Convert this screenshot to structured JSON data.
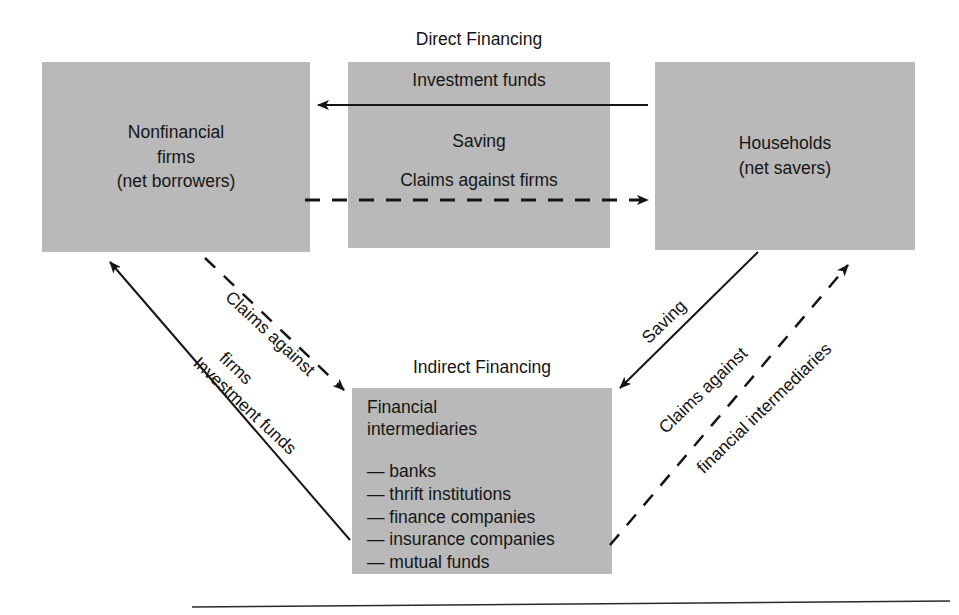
{
  "diagram": {
    "title_direct": "Direct Financing",
    "title_indirect": "Indirect Financing",
    "nodes": {
      "firms": {
        "line1": "Nonfinancial",
        "line2": "firms",
        "line3": "(net borrowers)"
      },
      "households": {
        "line1": "Households",
        "line2": "(net savers)"
      },
      "middle": {
        "label_top": "Investment funds",
        "label_mid": "Saving",
        "label_bottom": "Claims against firms"
      },
      "intermediaries": {
        "title_line1": "Financial",
        "title_line2": "intermediaries",
        "items": [
          "— banks",
          "— thrift institutions",
          "— finance companies",
          "— insurance companies",
          "— mutual funds"
        ]
      }
    },
    "flows": {
      "left_dashed": {
        "line1": "Claims against",
        "line2": "firms"
      },
      "left_solid": "Investment funds",
      "right_solid": "Saving",
      "right_dashed": {
        "line1": "Claims against",
        "line2": "financial intermediaries"
      }
    },
    "colors": {
      "box_fill": "#b9b9b9",
      "ink": "#151515",
      "page": "#ffffff"
    }
  }
}
